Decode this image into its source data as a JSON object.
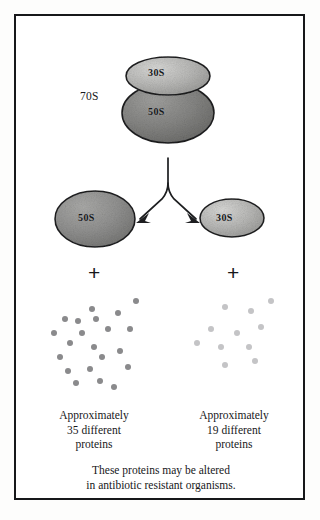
{
  "figure": {
    "frame_color": "#17181a",
    "background": "#ffffff"
  },
  "complex": {
    "label": "70S",
    "small_subunit_label": "30S",
    "large_subunit_label": "50S"
  },
  "arrow": {
    "name": "branching-dissociation-arrow",
    "direction": "downward-split"
  },
  "products": {
    "left": {
      "subunit_label": "50S",
      "plus": "+",
      "dot_color": "#8a8a8c",
      "dot_count": 21,
      "dots": [
        [
          44,
          14
        ],
        [
          17,
          24
        ],
        [
          30,
          26
        ],
        [
          48,
          24
        ],
        [
          70,
          18
        ],
        [
          88,
          6
        ],
        [
          6,
          38
        ],
        [
          34,
          38
        ],
        [
          60,
          34
        ],
        [
          82,
          34
        ],
        [
          22,
          48
        ],
        [
          46,
          52
        ],
        [
          12,
          62
        ],
        [
          54,
          62
        ],
        [
          72,
          56
        ],
        [
          20,
          76
        ],
        [
          42,
          74
        ],
        [
          80,
          72
        ],
        [
          28,
          88
        ],
        [
          52,
          86
        ],
        [
          66,
          92
        ]
      ],
      "caption_line1": "Approximately",
      "caption_line2": "35 different",
      "caption_line3": "proteins"
    },
    "right": {
      "subunit_label": "30S",
      "plus": "+",
      "dot_color": "#c4c4c6",
      "dot_count": 11,
      "dots": [
        [
          32,
          8
        ],
        [
          58,
          12
        ],
        [
          78,
          2
        ],
        [
          18,
          30
        ],
        [
          44,
          34
        ],
        [
          68,
          28
        ],
        [
          4,
          44
        ],
        [
          28,
          48
        ],
        [
          56,
          48
        ],
        [
          32,
          66
        ],
        [
          62,
          62
        ]
      ],
      "caption_line1": "Approximately",
      "caption_line2": "19 different",
      "caption_line3": "proteins"
    }
  },
  "footer": {
    "line1": "These proteins may be altered",
    "line2": "in antibiotic resistant organisms."
  }
}
